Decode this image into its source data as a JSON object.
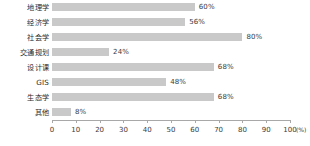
{
  "chart_data": {
    "type": "bar",
    "orientation": "horizontal",
    "title": "",
    "xlabel": "(%)",
    "ylabel": "",
    "xlim": [
      0,
      100
    ],
    "grid": false,
    "legend": null,
    "categories": [
      "地理学",
      "经济学",
      "社会学",
      "交通规划",
      "设计课",
      "GIS",
      "生态学",
      "其他"
    ],
    "values": [
      60,
      56,
      80,
      24,
      68,
      48,
      68,
      8
    ],
    "value_labels": [
      "60%",
      "56%",
      "80%",
      "24%",
      "68%",
      "48%",
      "68%",
      "8%"
    ],
    "xticks": [
      0,
      10,
      20,
      30,
      40,
      50,
      60,
      70,
      80,
      90,
      100
    ],
    "xtick_labels": [
      "0",
      "10",
      "20",
      "30",
      "40",
      "50",
      "60",
      "70",
      "80",
      "90",
      "100"
    ],
    "unit_suffix": "(%)",
    "bar_color": "#c9c9c9",
    "axis_color": "#a8a8a8",
    "text_color": "#2b2b2b"
  }
}
